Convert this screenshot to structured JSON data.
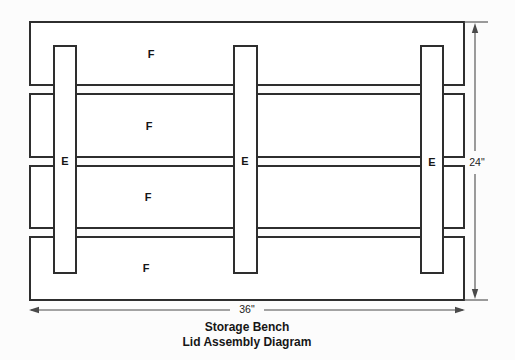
{
  "diagram": {
    "title": "Storage Bench",
    "subtitle": "Lid Assembly Diagram",
    "boards": [
      {
        "label": "F"
      },
      {
        "label": "F"
      },
      {
        "label": "F"
      },
      {
        "label": "F"
      }
    ],
    "cleats": [
      {
        "label": "E"
      },
      {
        "label": "E"
      },
      {
        "label": "E"
      }
    ],
    "dimensions": {
      "width": "36\"",
      "height": "24\""
    },
    "colors": {
      "outline": "#2e2e2e",
      "dimension": "#4a4a4a",
      "background": "#fcfcfc"
    }
  }
}
